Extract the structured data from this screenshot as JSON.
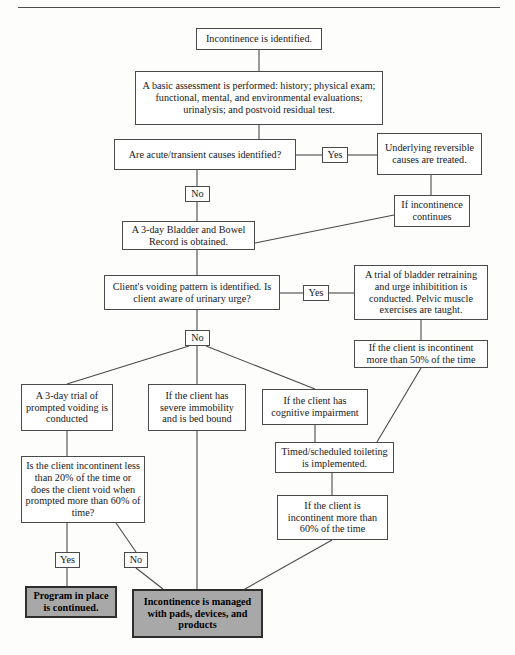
{
  "colors": {
    "line": "#4a4a4a",
    "box_fill": "#ffffff",
    "shaded_fill": "#a8a8a8",
    "text": "#17171a",
    "rule": "#4d4d50"
  },
  "nodes": [
    {
      "id": "start",
      "text": "Incontinence is identified."
    },
    {
      "id": "assessment",
      "text": "A basic assessment is performed: history; physical exam; functional, mental, and environmental evaluations; urinalysis; and postvoid residual test."
    },
    {
      "id": "acute_question",
      "text": "Are acute/transient causes identified?"
    },
    {
      "id": "reversible_treated",
      "text": "Underlying reversible causes are treated."
    },
    {
      "id": "if_continues",
      "text": "If incontinence continues"
    },
    {
      "id": "bladder_record",
      "text": "A 3-day Bladder and Bowel Record is obtained."
    },
    {
      "id": "voiding_question",
      "text": "Client's voiding pattern is identified. Is client aware of urinary urge?"
    },
    {
      "id": "bladder_retraining",
      "text": "A trial of bladder retraining and urge inhibitition is conducted. Pelvic muscle exercises are taught."
    },
    {
      "id": "incontinent_50",
      "text": "If the client is incontinent more than 50% of the time"
    },
    {
      "id": "prompted_voiding",
      "text": "A 3-day trial of prompted voiding is conducted"
    },
    {
      "id": "severe_immobility",
      "text": "If the client has severe immobility and is bed bound"
    },
    {
      "id": "cognitive",
      "text": "If the client has cognitive impairment"
    },
    {
      "id": "timed_toileting",
      "text": "Timed/scheduled toileting is implemented."
    },
    {
      "id": "incontinent_60",
      "text": "If the client is incontinent more than 60% of the time"
    },
    {
      "id": "prompted_question",
      "text": "Is the client incontinent less than 20% of the time or does the client void when prompted more than 60% of time?"
    },
    {
      "id": "program_continued",
      "text": "Program in place is continued."
    },
    {
      "id": "managed_pads",
      "text": "Incontinence is managed with pads, devices, and products"
    }
  ],
  "edge_labels": [
    {
      "id": "yes_acute",
      "text": "Yes"
    },
    {
      "id": "no_acute",
      "text": "No"
    },
    {
      "id": "yes_voiding",
      "text": "Yes"
    },
    {
      "id": "no_voiding",
      "text": "No"
    },
    {
      "id": "yes_prompted",
      "text": "Yes"
    },
    {
      "id": "no_prompted",
      "text": "No"
    }
  ]
}
